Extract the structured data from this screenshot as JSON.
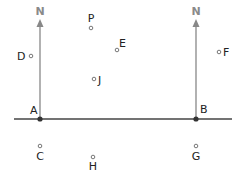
{
  "diagram": {
    "north_labels": [
      "N",
      "N"
    ],
    "baseline": {
      "points": [
        "A",
        "B"
      ]
    },
    "points": [
      {
        "id": "A",
        "label": "A",
        "x": 40,
        "y": 119,
        "type": "filled"
      },
      {
        "id": "B",
        "label": "B",
        "x": 196,
        "y": 119,
        "type": "filled"
      },
      {
        "id": "P",
        "label": "P",
        "x": 91,
        "y": 28,
        "type": "hollow"
      },
      {
        "id": "E",
        "label": "E",
        "x": 117,
        "y": 50,
        "type": "hollow"
      },
      {
        "id": "D",
        "label": "D",
        "x": 31,
        "y": 56,
        "type": "hollow"
      },
      {
        "id": "J",
        "label": "J",
        "x": 94,
        "y": 79,
        "type": "hollow"
      },
      {
        "id": "F",
        "label": "F",
        "x": 219,
        "y": 52,
        "type": "hollow"
      },
      {
        "id": "C",
        "label": "C",
        "x": 40,
        "y": 146,
        "type": "hollow"
      },
      {
        "id": "H",
        "label": "H",
        "x": 93,
        "y": 157,
        "type": "hollow"
      },
      {
        "id": "G",
        "label": "G",
        "x": 196,
        "y": 146,
        "type": "hollow"
      }
    ],
    "colors": {
      "line": "#444444",
      "arrow": "#888888",
      "text": "#222222"
    }
  }
}
